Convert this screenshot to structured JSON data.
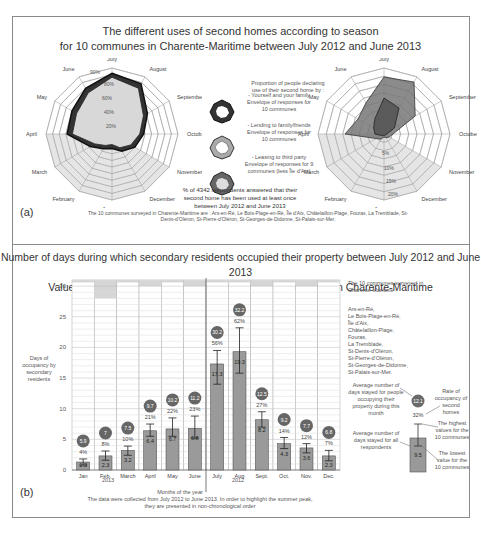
{
  "figure": {
    "panel_a": {
      "label": "(a)",
      "title_line1": "The different uses of second homes according to season",
      "title_line2": "for 10 communes in Charente-Maritime between July 2012 and June 2013",
      "legend_heading": "Proportion of people declaring use of their second home by :",
      "legend_items": [
        {
          "label": "- Yourself and your family Envelope of responses for 10 communes"
        },
        {
          "label": "- Lending to family/friends Envelope of responses for 10 communes"
        },
        {
          "label": "- Leasing to third party Envelope of responses for 9 communes (less Île d'Aix)"
        }
      ],
      "note": "% of 4342 respondents answered that their second home has been used at least once between July 2012 and June 2013",
      "footnote": "The 10 communes surveyed in Charente-Maritime are : Ars-en-Ré, Le Bois-Plage-en-Ré, Île d'Aix, Châtelaillon-Plage, Fouras, La Tremblade, St-Denis-d'Oléron, St-Pierre-d'Oléron, St-Georges-de-Didonne, St-Palais-sur-Mer."
    },
    "panel_b": {
      "label": "(b)",
      "title_line1": "Number of days during which secondary residents occupied their property between July 2012 and June 2013",
      "title_line2": "Values calculated based on 10 coastal and island communes in Charente-Maritime",
      "ylabel": "Days of occupancy by secondary residents",
      "xlabel": "Months of the year",
      "year_left": "2013",
      "year_right": "2012",
      "caption_line1": "The data were collected from July 2012 to June 2013. In order to highlight the summer peak,",
      "caption_line2": "they are presented in non-chronological order",
      "communes_heading": "The 10 communes surveyed in Charente-Maritime :",
      "communes": [
        "Ars-en-Ré,",
        "Le Bois-Plage-en-Ré,",
        "Île d'Aix,",
        "Châtelaillon-Plage,",
        "Fouras,",
        "La Tremblade,",
        "St-Denis-d'Oléron,",
        "St-Pierre-d'Oléron,",
        "St-Georges-de-Didonne,",
        "St-Palais-sur-Mer."
      ],
      "key": {
        "circle_desc": "Average number of days stayed for people occupying their property during this month",
        "circle_value": "12.1",
        "pct_value": "32%",
        "rate_desc": "Rate of occupancy of second homes",
        "bar_desc": "Average number of days stayed for all respondents",
        "bar_value": "9.5",
        "high_desc": "The highest values for the 10 communes",
        "low_desc": "The lowest value for the 10 communes"
      }
    }
  },
  "chart_data": [
    {
      "type": "radar",
      "title": "Proportion of people declaring use of their second home by yourself and your family (and lending to family/friends)",
      "categories": [
        "July",
        "August",
        "September",
        "October",
        "November",
        "December",
        "January",
        "February",
        "March",
        "April",
        "May",
        "June"
      ],
      "radial_ticks": [
        "20%",
        "40%",
        "60%",
        "80%",
        "90%"
      ],
      "series": [
        {
          "name": "Yourself and your family (max envelope)",
          "values": [
            92,
            88,
            62,
            48,
            40,
            30,
            22,
            26,
            38,
            68,
            70,
            80
          ]
        },
        {
          "name": "Yourself and your family (min envelope)",
          "values": [
            86,
            80,
            55,
            42,
            33,
            24,
            16,
            20,
            30,
            60,
            62,
            72
          ]
        }
      ]
    },
    {
      "type": "radar",
      "title": "Proportion of people declaring use of second home — lending and leasing",
      "categories": [
        "July",
        "August",
        "September",
        "October",
        "November",
        "December",
        "January",
        "February",
        "March",
        "April",
        "May",
        "June"
      ],
      "radial_ticks": [
        "5%",
        "10%",
        "15%",
        "20%"
      ],
      "series": [
        {
          "name": "Lending to family/friends (envelope)",
          "values": [
            19,
            20,
            12,
            3,
            2,
            1.5,
            1,
            2,
            3,
            13,
            10,
            12
          ]
        },
        {
          "name": "Leasing to third party (envelope)",
          "values": [
            12,
            10,
            4,
            1,
            0.5,
            0.5,
            0.5,
            0.5,
            1,
            3,
            4,
            6
          ]
        }
      ]
    },
    {
      "type": "bar",
      "title": "Number of days during which secondary residents occupied their property between July 2012 and June 2013",
      "xlabel": "Months of the year",
      "ylabel": "Days of occupancy by secondary residents",
      "ylim": [
        0,
        31
      ],
      "yticks": [
        0,
        5,
        10,
        15,
        20,
        25,
        30
      ],
      "categories": [
        "Jan",
        "Feb.",
        "March",
        "April",
        "May",
        "June",
        "July",
        "Aug",
        "Sept.",
        "Oct.",
        "Nov.",
        "Dec."
      ],
      "series": [
        {
          "name": "Average number of days stayed for all respondents",
          "values": [
            1.3,
            2.3,
            3.2,
            6.4,
            6.7,
            6.8,
            17.3,
            19.3,
            8.2,
            4.3,
            3.6,
            2.3
          ]
        },
        {
          "name": "Average number of days stayed for people occupying their property",
          "values": [
            5.9,
            7.0,
            7.5,
            9.7,
            10.2,
            11.2,
            30.2,
            32.2,
            12.5,
            9.2,
            7.7,
            6.8
          ]
        },
        {
          "name": "Rate of occupancy of second homes (%)",
          "values": [
            4,
            8,
            10,
            21,
            22,
            23,
            56,
            62,
            27,
            14,
            12,
            7
          ]
        },
        {
          "name": "Highest value (error bar top)",
          "values": [
            1.8,
            3.1,
            3.9,
            7.5,
            8.5,
            8.8,
            19.5,
            23.2,
            9.5,
            5.3,
            4.3,
            3.2
          ]
        },
        {
          "name": "Lowest value (error bar bottom)",
          "values": [
            0.8,
            1.6,
            2.4,
            5.5,
            5.5,
            5.2,
            14.0,
            15.8,
            7.0,
            3.5,
            2.8,
            1.5
          ]
        }
      ],
      "days_in_month": [
        31,
        28,
        31,
        30,
        31,
        30,
        31,
        31,
        30,
        31,
        30,
        31
      ],
      "grid": true
    }
  ]
}
